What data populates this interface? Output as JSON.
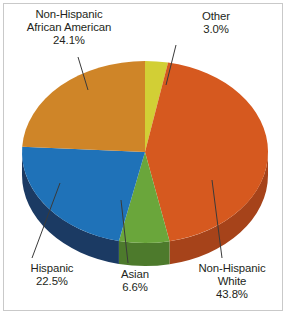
{
  "chart_data": {
    "type": "pie",
    "title": "",
    "subtitle": "",
    "xlabel": "",
    "ylabel": "",
    "legend_position": "none",
    "grid": false,
    "style": "3d-pie",
    "categories": [
      "Non-Hispanic White",
      "Non-Hispanic African American",
      "Hispanic",
      "Asian",
      "Other"
    ],
    "values": [
      43.8,
      24.1,
      22.5,
      6.6,
      3.0
    ],
    "unit": "%",
    "slices": [
      {
        "label": "Other",
        "value": 3.0,
        "value_text": "3.0%",
        "color": "#d2cf35",
        "side_color": "#a8a42a",
        "start_angle": 0,
        "end_angle": 10.8
      },
      {
        "label": "Non-Hispanic White",
        "value": 43.8,
        "value_text": "43.8%",
        "color": "#d6591f",
        "side_color": "#a6431a",
        "start_angle": 10.8,
        "end_angle": 168.48
      },
      {
        "label": "Asian",
        "value": 6.6,
        "value_text": "6.6%",
        "color": "#6aa63b",
        "side_color": "#4d7a2c",
        "start_angle": 168.48,
        "end_angle": 192.24
      },
      {
        "label": "Hispanic",
        "value": 22.5,
        "value_text": "22.5%",
        "color": "#1f72b8",
        "side_color": "#1b3a63",
        "start_angle": 192.24,
        "end_angle": 273.24
      },
      {
        "label": "Non-Hispanic African American",
        "value": 24.1,
        "value_text": "24.1%",
        "color": "#cf8528",
        "side_color": "#9c6320",
        "start_angle": 273.24,
        "end_angle": 360
      }
    ]
  },
  "labels": {
    "african_american": {
      "line1": "Non-Hispanic",
      "line2": "African American",
      "pct": "24.1%"
    },
    "other": {
      "line1": "Other",
      "pct": "3.0%"
    },
    "hispanic": {
      "line1": "Hispanic",
      "pct": "22.5%"
    },
    "asian": {
      "line1": "Asian",
      "pct": "6.6%"
    },
    "white": {
      "line1": "Non-Hispanic",
      "line2": "White",
      "pct": "43.8%"
    }
  },
  "colors": {
    "background": "#ffffff",
    "frame_border": "#c9c9c9",
    "text": "#231f20",
    "leader_line": "#3a3a3a"
  }
}
